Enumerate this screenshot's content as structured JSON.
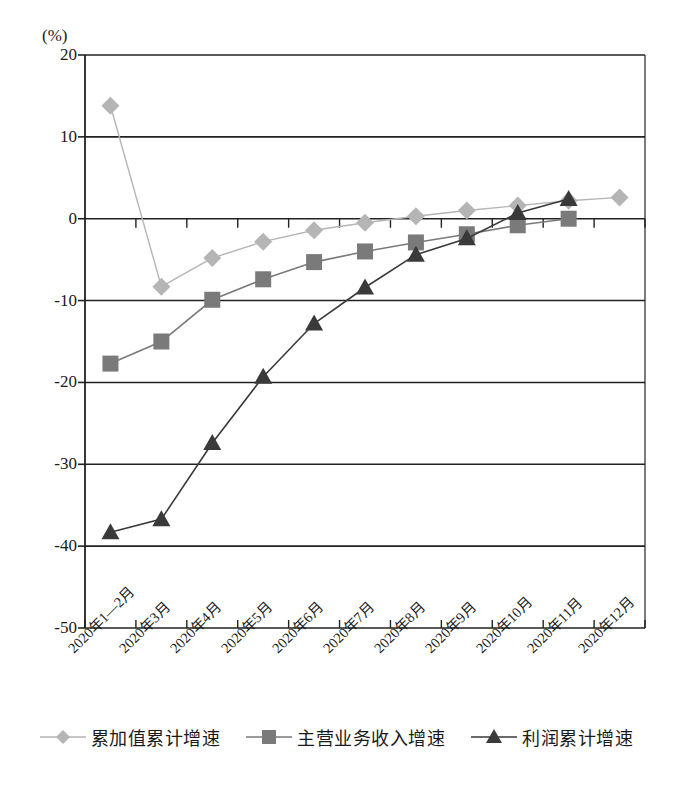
{
  "chart_data": {
    "type": "line",
    "title": "",
    "xlabel": "",
    "ylabel": "(%)",
    "ylim": [
      -50,
      20
    ],
    "yticks": [
      20,
      10,
      0,
      -10,
      -20,
      -30,
      -40,
      -50
    ],
    "ytick_labels": [
      "20",
      "10",
      "0",
      "-10",
      "-20",
      "-30",
      "-40",
      "-50"
    ],
    "grid": true,
    "legend_position": "bottom",
    "categories": [
      "2020年1—2月",
      "2020年3月",
      "2020年4月",
      "2020年5月",
      "2020年6月",
      "2020年7月",
      "2020年8月",
      "2020年9月",
      "2020年10月",
      "2020年11月",
      "2020年12月"
    ],
    "series": [
      {
        "name": "累加值累计增速",
        "marker": "diamond",
        "color": "#b5b5b5",
        "values": [
          13.8,
          -8.3,
          -4.8,
          -2.8,
          -1.4,
          -0.5,
          0.3,
          1.0,
          1.6,
          2.2,
          2.6
        ]
      },
      {
        "name": "主营业务收入增速",
        "marker": "square",
        "color": "#7a7a7a",
        "values": [
          -17.7,
          -15.0,
          -9.9,
          -7.4,
          -5.3,
          -4.0,
          -2.9,
          -1.9,
          -0.8,
          0.0,
          null
        ]
      },
      {
        "name": "利润累计增速",
        "marker": "triangle",
        "color": "#3a3a3a",
        "values": [
          -38.3,
          -36.7,
          -27.4,
          -19.3,
          -12.8,
          -8.4,
          -4.4,
          -2.4,
          0.7,
          2.4,
          null
        ]
      }
    ]
  },
  "axis": {
    "unit": "(%)"
  },
  "legend": {
    "items": [
      {
        "label": "累加值累计增速",
        "marker": "diamond-marker-icon",
        "color": "#b5b5b5"
      },
      {
        "label": "主营业务收入增速",
        "marker": "square-marker-icon",
        "color": "#7a7a7a"
      },
      {
        "label": "利润累计增速",
        "marker": "triangle-marker-icon",
        "color": "#3a3a3a"
      }
    ]
  },
  "colors": {
    "axis": "#222222",
    "grid": "#222222",
    "series1": "#b5b5b5",
    "series2": "#7a7a7a",
    "series3": "#3a3a3a"
  }
}
